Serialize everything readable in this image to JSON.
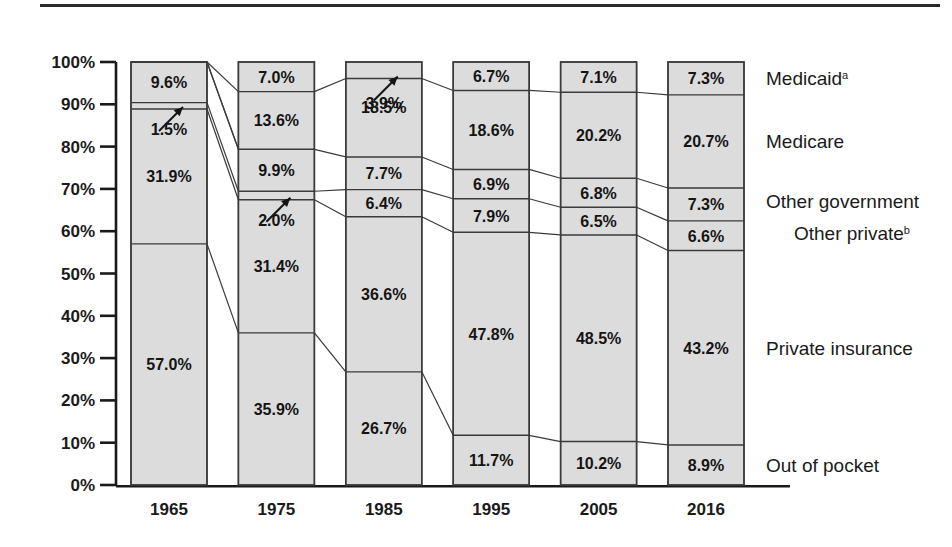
{
  "chart_data": {
    "type": "bar",
    "subtype": "stacked-100-percent",
    "title": "",
    "xlabel": "",
    "ylabel": "",
    "ylim": [
      0,
      100
    ],
    "grid": false,
    "legend_position": "right-inline",
    "categories": [
      "1965",
      "1975",
      "1985",
      "1995",
      "2005",
      "2016"
    ],
    "ytick_labels": [
      "0%",
      "10%",
      "20%",
      "30%",
      "40%",
      "50%",
      "60%",
      "70%",
      "80%",
      "90%",
      "100%"
    ],
    "ytick_values": [
      0,
      10,
      20,
      30,
      40,
      50,
      60,
      70,
      80,
      90,
      100
    ],
    "stack_order_top_to_bottom": [
      "Medicaid",
      "Medicare",
      "Other government",
      "Other private",
      "Private insurance",
      "Out of pocket"
    ],
    "series": [
      {
        "name": "Medicaid",
        "label": "Medicaid",
        "superscript": "a",
        "values": [
          null,
          7.0,
          3.9,
          6.7,
          7.1,
          7.3
        ],
        "display": [
          "",
          "7.0%",
          "3.9%",
          "6.7%",
          "7.1%",
          "7.3%"
        ]
      },
      {
        "name": "Medicare",
        "label": "Medicare",
        "superscript": "",
        "values": [
          null,
          13.6,
          18.5,
          18.6,
          20.2,
          20.7
        ],
        "display": [
          "",
          "13.6%",
          "18.5%",
          "18.6%",
          "20.2%",
          "20.7%"
        ]
      },
      {
        "name": "Other government",
        "label": "Other government",
        "superscript": "",
        "values": [
          9.6,
          9.9,
          7.7,
          6.9,
          6.8,
          7.3
        ],
        "display": [
          "9.6%",
          "9.9%",
          "7.7%",
          "6.9%",
          "6.8%",
          "7.3%"
        ]
      },
      {
        "name": "Other private",
        "label": "Other private",
        "superscript": "b",
        "values": [
          1.5,
          2.0,
          6.4,
          7.9,
          6.5,
          6.6
        ],
        "display": [
          "1.5%",
          "2.0%",
          "6.4%",
          "7.9%",
          "6.5%",
          "6.6%"
        ]
      },
      {
        "name": "Private insurance",
        "label": "Private insurance",
        "superscript": "",
        "values": [
          31.9,
          31.4,
          36.6,
          47.8,
          48.5,
          43.2
        ],
        "display": [
          "31.9%",
          "31.4%",
          "36.6%",
          "47.8%",
          "48.5%",
          "43.2%"
        ]
      },
      {
        "name": "Out of pocket",
        "label": "Out of pocket",
        "superscript": "",
        "values": [
          57.0,
          35.9,
          26.7,
          11.7,
          10.2,
          8.9
        ],
        "display": [
          "57.0%",
          "35.9%",
          "26.7%",
          "11.7%",
          "10.2%",
          "8.9%"
        ]
      }
    ],
    "annotations": [
      {
        "series": "Other private",
        "category": "1965",
        "kind": "arrow-to-thin-segment"
      },
      {
        "series": "Other private",
        "category": "1975",
        "kind": "arrow-to-thin-segment"
      },
      {
        "series": "Medicaid",
        "category": "1985",
        "kind": "arrow-to-thin-segment"
      }
    ],
    "colors": {
      "segment_fill": "#dcdcdc",
      "segment_stroke": "#3a3a3a",
      "axis": "#1a1a1a",
      "text": "#1a1a1a"
    }
  }
}
